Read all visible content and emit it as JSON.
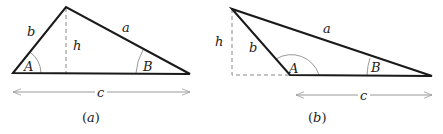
{
  "figures": [
    {
      "id": "a",
      "caption": "(a)",
      "caption_letter": "a",
      "sides": {
        "a": "a",
        "b": "b",
        "c": "c"
      },
      "angles": {
        "A": "A",
        "B": "B"
      },
      "height_label": "h",
      "description": "Acute triangle with altitude h dropped inside from the top vertex to base c"
    },
    {
      "id": "b",
      "caption": "(b)",
      "caption_letter": "b",
      "sides": {
        "a": "a",
        "b": "b",
        "c": "c"
      },
      "angles": {
        "A": "A",
        "B": "B"
      },
      "height_label": "h",
      "description": "Obtuse triangle at A with altitude h falling outside, base c extended (dashed)"
    }
  ],
  "colors": {
    "stroke": "#1a1a1a",
    "dashed": "#888888",
    "arc": "#999999",
    "arrow": "#999999",
    "text": "#222222"
  }
}
